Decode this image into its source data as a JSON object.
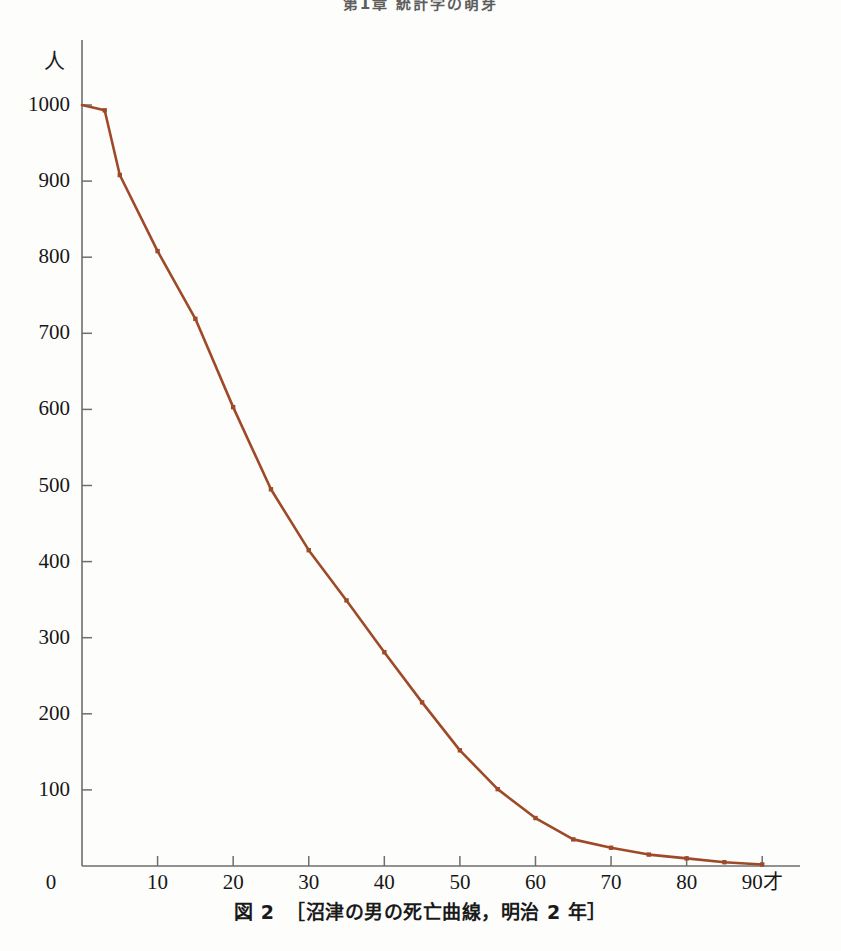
{
  "page": {
    "running_head": "第1章 統計学の萌芽",
    "background_color": "#fdfdfc"
  },
  "figure": {
    "caption_number": "図 2",
    "caption_text": "［沼津の男の死亡曲線，明治 2 年］",
    "y_axis_unit": "人",
    "x_axis_unit": "才"
  },
  "chart_data": {
    "type": "line",
    "subtitle": "",
    "xlabel": "才",
    "ylabel": "人",
    "xlim": [
      0,
      95
    ],
    "ylim": [
      0,
      1000
    ],
    "grid": false,
    "legend": "none",
    "line_color": "#9e4a28",
    "marker_color": "#9e4a28",
    "marker_shape": "square",
    "x_ticks": [
      0,
      10,
      20,
      30,
      40,
      50,
      60,
      70,
      80,
      90
    ],
    "x_tick_labels": [
      "0",
      "10",
      "20",
      "30",
      "40",
      "50",
      "60",
      "70",
      "80",
      "90才"
    ],
    "y_ticks": [
      0,
      100,
      200,
      300,
      400,
      500,
      600,
      700,
      800,
      900,
      1000
    ],
    "y_tick_labels": [
      "0",
      "100",
      "200",
      "300",
      "400",
      "500",
      "600",
      "700",
      "800",
      "900",
      "1000"
    ],
    "x": [
      0,
      3,
      5,
      10,
      15,
      20,
      25,
      30,
      35,
      40,
      45,
      50,
      55,
      60,
      65,
      70,
      75,
      80,
      85,
      90
    ],
    "values": [
      1000,
      993,
      908,
      808,
      719,
      603,
      495,
      415,
      349,
      281,
      215,
      152,
      101,
      63,
      35,
      24,
      15,
      10,
      5,
      2
    ],
    "series": [
      {
        "name": "沼津の男の生存数",
        "values": [
          1000,
          993,
          908,
          808,
          719,
          603,
          495,
          415,
          349,
          281,
          215,
          152,
          101,
          63,
          35,
          24,
          15,
          10,
          5,
          2
        ]
      }
    ]
  }
}
